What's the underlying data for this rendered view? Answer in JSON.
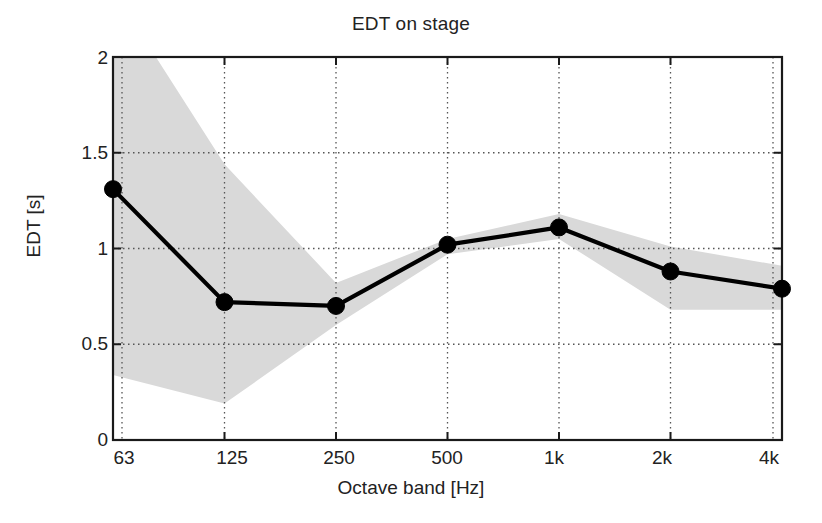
{
  "chart_data": {
    "type": "line",
    "title": "EDT on stage",
    "xlabel": "Octave band [Hz]",
    "ylabel": "EDT [s]",
    "categories": [
      "63",
      "125",
      "250",
      "500",
      "1k",
      "2k",
      "4k"
    ],
    "xtick_labels": [
      "63",
      "125",
      "250",
      "500",
      "1k",
      "2k",
      "4k"
    ],
    "ytick_labels": [
      "2",
      "1.5",
      "1",
      "0.5",
      "0"
    ],
    "ytick_values": [
      2,
      1.5,
      1,
      0.5,
      0
    ],
    "ylim": [
      0,
      2
    ],
    "xlim": [
      0,
      6
    ],
    "grid": true,
    "grid_style": "dotted",
    "legend": null,
    "series": [
      {
        "name": "EDT mean",
        "values": [
          1.31,
          0.72,
          0.7,
          1.02,
          1.11,
          0.88,
          0.79
        ],
        "marker": "filled-circle",
        "color": "#000000"
      }
    ],
    "band": {
      "name": "range / spread",
      "upper": [
        2.35,
        1.44,
        0.82,
        1.05,
        1.18,
        1.01,
        0.91
      ],
      "lower": [
        0.34,
        0.19,
        0.6,
        0.97,
        1.05,
        0.68,
        0.68
      ],
      "color": "#d9d9d9",
      "clipped_at_top": true
    },
    "axes_color": "#1a1a1a",
    "background": "#ffffff"
  }
}
